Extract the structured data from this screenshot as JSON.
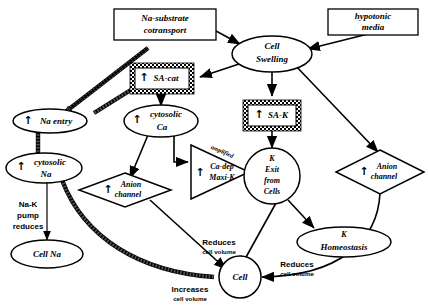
{
  "diagram": {
    "background_color": "#ffffff",
    "line_color": "#000000",
    "nodes": {
      "na_substrate_cotransport": {
        "label_line1": "Na-substrate",
        "label_line2": "cotransport",
        "shape": "rectangle"
      },
      "hypotonic_media": {
        "label_line1": "hypotonic",
        "label_line2": "media",
        "shape": "rectangle"
      },
      "cell_swelling": {
        "label_line1": "Cell",
        "label_line2": "Swelling",
        "shape": "ellipse"
      },
      "sa_cat": {
        "label": "SA-cat",
        "arrow": "↑",
        "shape": "hatched-box"
      },
      "sa_k": {
        "label": "SA-K",
        "arrow": "↑",
        "shape": "hatched-box"
      },
      "na_entry": {
        "label": "Na entry",
        "arrow": "↑",
        "shape": "ellipse"
      },
      "cytosolic_ca": {
        "label_line1": "cytosolic",
        "label_line2": "Ca",
        "arrow": "↑",
        "shape": "ellipse"
      },
      "cytosolic_na": {
        "label_line1": "cytosolic",
        "label_line2": "Na",
        "arrow": "↑",
        "shape": "ellipse"
      },
      "cell_na": {
        "label": "Cell Na",
        "shape": "ellipse"
      },
      "anion_channel_left": {
        "label_line1": "Anion",
        "label_line2": "channel",
        "arrow": "↑",
        "shape": "diamond"
      },
      "anion_channel_right": {
        "label_line1": "Anion",
        "label_line2": "channel",
        "arrow": "↑",
        "shape": "diamond"
      },
      "ca_dep_maxi_k": {
        "label_line1": "Ca-dep",
        "label_line2": "Maxi-K",
        "arrow": "↑",
        "shape": "triangle"
      },
      "k_exit_from_cells": {
        "label_line1": "K",
        "label_line2": "Exit",
        "label_line3": "from",
        "label_line4": "Cells",
        "shape": "ellipse"
      },
      "k_homeostasis": {
        "label_line1": "K",
        "label_line2": "Homeostasis",
        "shape": "ellipse"
      },
      "cell": {
        "label": "Cell",
        "shape": "circle"
      }
    },
    "edge_labels": {
      "amplified": "amplified",
      "na_k_pump_reduces_l1": "Na-K",
      "na_k_pump_reduces_l2": "pump",
      "na_k_pump_reduces_l3": "reduces",
      "reduces_center_l1": "Reduces",
      "reduces_center_l2": "cell volume",
      "reduces_right_l1": "Reduces",
      "reduces_right_l2": "cell volume",
      "increases_l1": "Increases",
      "increases_l2": "cell volume"
    }
  }
}
